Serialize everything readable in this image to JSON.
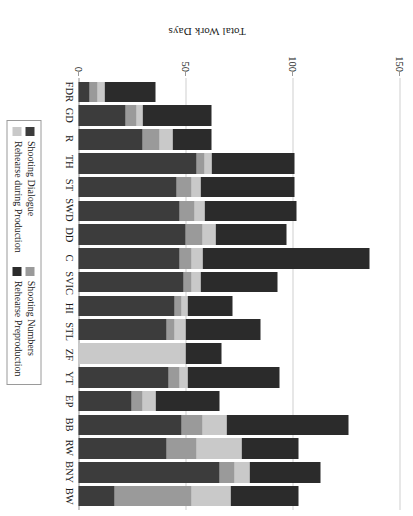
{
  "chart_data": {
    "type": "bar",
    "subtype": "stacked-bar",
    "orientation": "vertical-rotated-90",
    "title": "",
    "xlabel": "",
    "ylabel": "Total Work Days",
    "ylim": [
      0,
      150
    ],
    "yticks": [
      0,
      50,
      100,
      150
    ],
    "ytick_labels": [
      "0",
      "50",
      "100",
      "150"
    ],
    "grid": true,
    "grid_axis": "y",
    "legend_position": "bottom-center",
    "categories": [
      "FDR",
      "GD",
      "R",
      "TH",
      "ST",
      "SWD",
      "DD",
      "C",
      "SVIC",
      "HI",
      "STL",
      "ZF",
      "YT",
      "EP",
      "BB",
      "RW",
      "BNY",
      "BW"
    ],
    "series": [
      {
        "name": "Shooting Dialogue",
        "color": "#3c3c3c",
        "values": [
          5,
          22,
          30,
          55,
          46,
          47,
          50,
          47,
          49,
          45,
          41,
          0,
          42,
          25,
          48,
          41,
          66,
          17
        ]
      },
      {
        "name": "Shooting Numbers",
        "color": "#9a9a9a",
        "values": [
          4,
          5,
          8,
          4,
          7,
          7,
          8,
          6,
          4,
          3,
          4,
          0,
          5,
          5,
          10,
          14,
          7,
          36
        ]
      },
      {
        "name": "Rehearse during Production",
        "color": "#c9c9c9",
        "values": [
          3,
          3,
          6,
          3,
          4,
          5,
          6,
          5,
          4,
          3,
          5,
          50,
          4,
          6,
          11,
          21,
          7,
          18
        ]
      },
      {
        "name": "Rehearse Preproduction",
        "color": "#2b2b2b",
        "values": [
          24,
          32,
          18,
          39,
          44,
          43,
          33,
          78,
          36,
          21,
          35,
          17,
          43,
          30,
          57,
          27,
          33,
          32
        ]
      }
    ],
    "legend_entries": [
      {
        "label": "Shooting Dialogue",
        "color": "#3c3c3c"
      },
      {
        "label": "Shooting Numbers",
        "color": "#9a9a9a"
      },
      {
        "label": "Rehearse during Production",
        "color": "#c9c9c9"
      },
      {
        "label": "Rehearse Preproduction",
        "color": "#2b2b2b"
      }
    ]
  }
}
